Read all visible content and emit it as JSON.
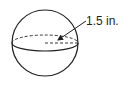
{
  "figure": {
    "shape": "sphere",
    "radius_label": "1.5 in.",
    "stroke_color": "#231f20",
    "background": "#ffffff"
  }
}
